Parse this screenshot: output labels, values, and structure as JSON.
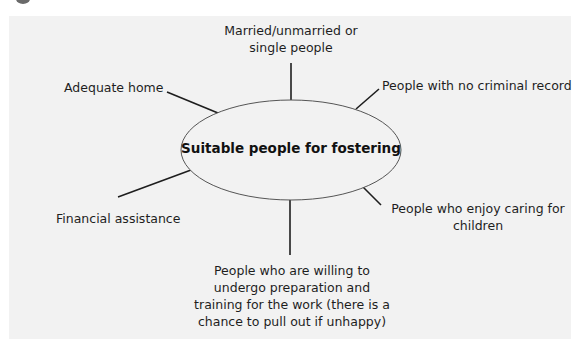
{
  "diagram": {
    "type": "spider-diagram",
    "colors": {
      "background": "#ffffff",
      "panel": "#f2f2f2",
      "lines": "#1e1e1e",
      "ellipse_stroke": "#555555",
      "text": "#1e1e1e"
    },
    "center": {
      "label": "Suitable people for fostering"
    },
    "branches": [
      {
        "id": "top",
        "lines": [
          "Married/unmarried or",
          "single people"
        ]
      },
      {
        "id": "top-right",
        "lines": [
          "People with no criminal record"
        ]
      },
      {
        "id": "top-left",
        "lines": [
          "Adequate home"
        ]
      },
      {
        "id": "bottom-left",
        "lines": [
          "Financial assistance"
        ]
      },
      {
        "id": "bottom-right",
        "lines": [
          "People who enjoy caring for",
          "children"
        ]
      },
      {
        "id": "bottom",
        "lines": [
          "People who are willing to",
          "undergo preparation and",
          "training for the work (there is a",
          "chance to pull out if unhappy)"
        ]
      }
    ]
  }
}
